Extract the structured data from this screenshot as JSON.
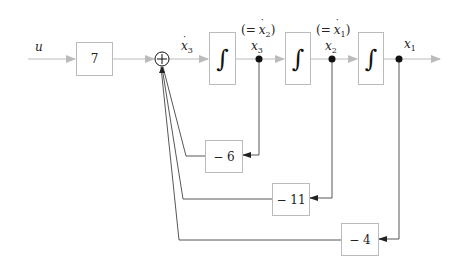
{
  "diagram": {
    "type": "block-diagram",
    "input": {
      "label": "u"
    },
    "gain_block": {
      "value": "7"
    },
    "summing_junction": {
      "symbol": "+"
    },
    "integrators": [
      {
        "symbol": "∫",
        "input_label": "x3-dot",
        "output_label": "x3",
        "output_alias": "(= x2-dot)"
      },
      {
        "symbol": "∫",
        "output_label": "x2",
        "output_alias": "(= x1-dot)"
      },
      {
        "symbol": "∫",
        "output_label": "x1"
      }
    ],
    "feedback_gains": [
      {
        "value": "− 6",
        "from": "x3"
      },
      {
        "value": "− 11",
        "from": "x2"
      },
      {
        "value": "− 4",
        "from": "x1"
      }
    ],
    "labels": {
      "u": "u",
      "x3dot_var": "x",
      "x3dot_sub": "3",
      "alias1_open": "(=",
      "alias1_var": "x",
      "alias1_sub": "2",
      "alias1_close": ")",
      "x3_var": "x",
      "x3_sub": "3",
      "alias2_open": "(=",
      "alias2_var": "x",
      "alias2_sub": "1",
      "alias2_close": ")",
      "x2_var": "x",
      "x2_sub": "2",
      "x1_var": "x",
      "x1_sub": "1"
    },
    "colors": {
      "forward_line": "#bbbbbb",
      "feedback_line": "#444444",
      "block_border": "#bbbbbb",
      "node": "#111111"
    }
  }
}
